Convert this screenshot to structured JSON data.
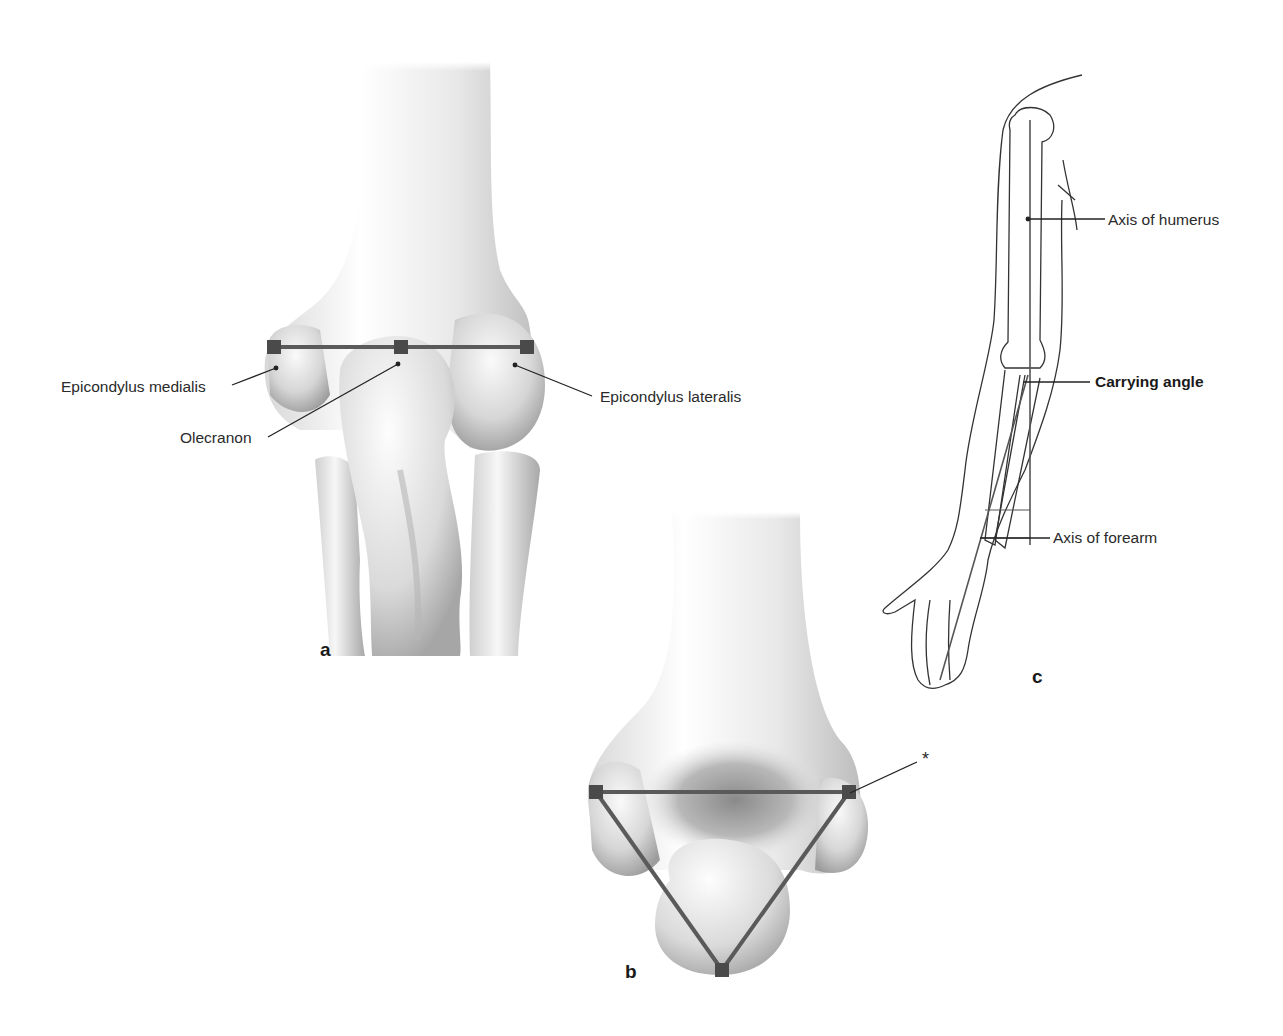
{
  "figure": {
    "panels": [
      {
        "id": "a",
        "letter": "a",
        "view": "elbow-posterior-extended",
        "labels": {
          "epicondylus_medialis": "Epicondylus medialis",
          "olecranon": "Olecranon",
          "epicondylus_lateralis": "Epicondylus lateralis"
        },
        "landmark_line": "straight line through three landmarks (Hueter's line)"
      },
      {
        "id": "b",
        "letter": "b",
        "view": "elbow-posterior-flexed",
        "labels": {
          "asterisk": "*"
        },
        "landmark_shape": "triangle (Hueter's triangle)"
      },
      {
        "id": "c",
        "letter": "c",
        "view": "arm-anterior-outline",
        "labels": {
          "axis_humerus": "Axis of humerus",
          "carrying_angle": "Carrying angle",
          "axis_forearm": "Axis of forearm"
        }
      }
    ],
    "colors": {
      "marker": "#4a4a4a",
      "landmark_line": "#5a5a5a",
      "leader_line": "#222222",
      "bone_light": "#f2f2f2",
      "bone_shadow": "#9a9a9a",
      "outline": "#333333",
      "background": "#ffffff"
    }
  }
}
